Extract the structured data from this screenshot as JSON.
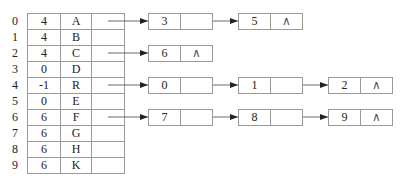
{
  "diagram": {
    "type": "adjacency-list-with-headnode-table",
    "indices": [
      "0",
      "1",
      "2",
      "3",
      "4",
      "5",
      "6",
      "7",
      "8",
      "9"
    ],
    "table": [
      {
        "parent": "4",
        "data": "A"
      },
      {
        "parent": "4",
        "data": "B"
      },
      {
        "parent": "4",
        "data": "C"
      },
      {
        "parent": "0",
        "data": "D"
      },
      {
        "parent": "-1",
        "data": "R"
      },
      {
        "parent": "0",
        "data": "E"
      },
      {
        "parent": "6",
        "data": "F"
      },
      {
        "parent": "6",
        "data": "G"
      },
      {
        "parent": "6",
        "data": "H"
      },
      {
        "parent": "6",
        "data": "K"
      }
    ],
    "null_symbol": "∧",
    "child_lists": [
      {
        "row": 0,
        "nodes": [
          {
            "value": "3",
            "ptr": ""
          },
          {
            "value": "5",
            "ptr": "∧"
          }
        ]
      },
      {
        "row": 2,
        "nodes": [
          {
            "value": "6",
            "ptr": "∧"
          }
        ]
      },
      {
        "row": 4,
        "nodes": [
          {
            "value": "0",
            "ptr": ""
          },
          {
            "value": "1",
            "ptr": ""
          },
          {
            "value": "2",
            "ptr": "∧"
          }
        ]
      },
      {
        "row": 6,
        "nodes": [
          {
            "value": "7",
            "ptr": ""
          },
          {
            "value": "8",
            "ptr": ""
          },
          {
            "value": "9",
            "ptr": "∧"
          }
        ]
      }
    ],
    "colors": {
      "line": "#9a9a9a",
      "arrow": "#222222",
      "text": "#222222"
    }
  }
}
